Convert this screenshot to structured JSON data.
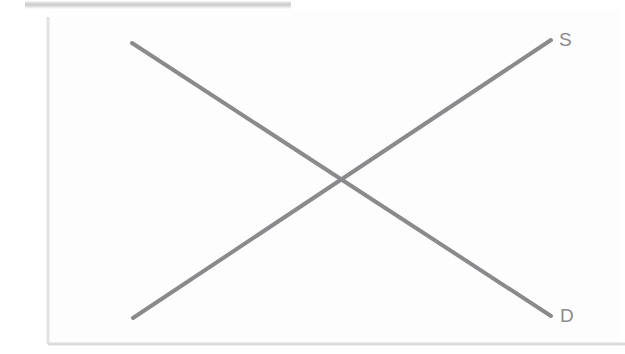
{
  "figure": {
    "background_color": "#ffffff",
    "plot_tint_color": "#fdfdfe"
  },
  "axes": {
    "y_axis": {
      "name": "vertical-axis",
      "color": "#e2e2e4",
      "x": 48,
      "y_top": 17,
      "y_bottom": 344,
      "width": 3
    },
    "x_axis": {
      "name": "horizontal-axis",
      "color": "#dcdcde",
      "y": 344,
      "x_left": 48,
      "x_right": 625,
      "width": 3
    }
  },
  "curves": {
    "supply": {
      "label": "S",
      "color": "#8a8a8c",
      "stroke_width": 4,
      "slope": "upward",
      "start": {
        "x": 133,
        "y": 318
      },
      "end": {
        "x": 551,
        "y": 40
      }
    },
    "demand": {
      "label": "D",
      "color": "#8a8a8c",
      "stroke_width": 4,
      "slope": "downward",
      "start": {
        "x": 132,
        "y": 43
      },
      "end": {
        "x": 551,
        "y": 316
      }
    }
  },
  "equilibrium": {
    "name": "intersection-point",
    "x": 343,
    "y": 180
  },
  "artifacts": {
    "scan_band": {
      "name": "scan-artifact-band",
      "x": 25,
      "y": 1,
      "width": 266,
      "height": 8,
      "color": "#c4c4c7"
    }
  },
  "chart_data": {
    "type": "line",
    "xlabel": "",
    "ylabel": "",
    "grid": false,
    "legend": "inline-endpoint-labels",
    "series": [
      {
        "name": "S",
        "description": "Supply curve, upward sloping",
        "x": [
          0.2,
          1.0
        ],
        "y": [
          0.08,
          0.93
        ],
        "color": "#8a8a8c"
      },
      {
        "name": "D",
        "description": "Demand curve, downward sloping",
        "x": [
          0.2,
          1.0
        ],
        "y": [
          0.92,
          0.09
        ],
        "color": "#8a8a8c"
      }
    ],
    "annotations": [
      {
        "text": "S",
        "x": 1.0,
        "y": 0.95,
        "name": "supply-curve-label"
      },
      {
        "text": "D",
        "x": 1.0,
        "y": 0.07,
        "name": "demand-curve-label"
      }
    ],
    "xlim": [
      0,
      1.1
    ],
    "ylim": [
      0,
      1.0
    ]
  }
}
